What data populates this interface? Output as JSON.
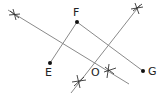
{
  "diagram": {
    "type": "geometry-construction",
    "colors": {
      "line": "#8a8a8a",
      "point": "#111111",
      "text": "#222222"
    },
    "points": [
      {
        "id": "F",
        "label": "F",
        "x": 77,
        "y": 22
      },
      {
        "id": "E",
        "label": "E",
        "x": 50,
        "y": 63
      },
      {
        "id": "G",
        "label": "G",
        "x": 143,
        "y": 71
      }
    ],
    "center_label": "O",
    "segments": [
      "EF",
      "FG"
    ],
    "bisectors": 2
  }
}
